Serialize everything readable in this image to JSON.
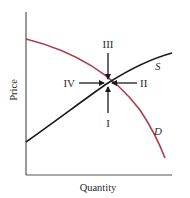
{
  "diagram": {
    "type": "supply-demand",
    "axes": {
      "x_label": "Quantity",
      "y_label": "Price"
    },
    "curves": [
      {
        "name": "supply",
        "label": "S",
        "color": "#1a1a1a"
      },
      {
        "name": "demand",
        "label": "D",
        "color": "#a8404a"
      }
    ],
    "arrows": [
      {
        "label": "I",
        "direction": "up",
        "position": "below"
      },
      {
        "label": "II",
        "direction": "left",
        "position": "right"
      },
      {
        "label": "III",
        "direction": "down",
        "position": "above"
      },
      {
        "label": "IV",
        "direction": "right",
        "position": "left"
      }
    ],
    "equilibrium": "intersection of S and D"
  }
}
